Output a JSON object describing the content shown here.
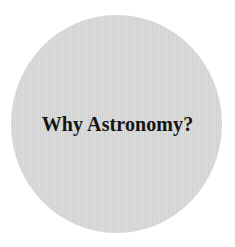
{
  "disc": {
    "color": "#d9d9d9"
  },
  "title": "Why Astronomy?"
}
